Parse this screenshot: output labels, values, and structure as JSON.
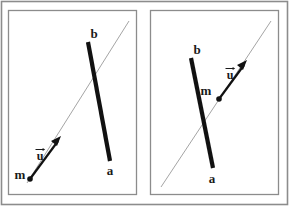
{
  "figure": {
    "width": 289,
    "height": 206,
    "background_color": "#ffffff",
    "outer_border_color": "#8c8c8c",
    "panel_border_color": "#8c8c8c",
    "thick_segment_color": "#111111",
    "thin_line_color": "#9a9a9a",
    "vector_color": "#111111",
    "label_color": "#1a1a1a"
  },
  "panels": [
    {
      "id": "left-panel",
      "name": "panel-left",
      "segment": {
        "name": "segment-ab",
        "endpoint_b_label": "b",
        "endpoint_a_label": "a",
        "b_x": 88,
        "b_y": 42,
        "a_x": 110,
        "a_y": 161,
        "stroke_width": 4.2
      },
      "labels": {
        "b": {
          "text": "b",
          "x": 95,
          "y": 37
        },
        "a": {
          "text": "a",
          "x": 107,
          "y": 173
        },
        "m": {
          "text": "m",
          "x": 16,
          "y": 178
        },
        "u": {
          "text": "u",
          "x": 37,
          "y": 157
        }
      },
      "point_m": {
        "name": "point-m",
        "x": 30,
        "y": 179,
        "r": 2.8
      },
      "vector_u": {
        "name": "vector-u",
        "from_x": 30,
        "from_y": 179,
        "to_x": 61,
        "to_y": 137,
        "stroke_width": 2.2,
        "label": "u",
        "has_arrow_accent": true
      },
      "thin_line": {
        "name": "parametric-line",
        "from_x": 27,
        "from_y": 183,
        "to_x": 129,
        "to_y": 21,
        "stroke_width": 0.9
      }
    },
    {
      "id": "right-panel",
      "name": "panel-right",
      "segment": {
        "name": "segment-ab",
        "endpoint_b_label": "b",
        "endpoint_a_label": "a",
        "b_x": 191,
        "b_y": 58,
        "a_x": 213,
        "a_y": 168,
        "stroke_width": 4.2
      },
      "labels": {
        "b": {
          "text": "b",
          "x": 196,
          "y": 53
        },
        "a": {
          "text": "a",
          "x": 208,
          "y": 182
        },
        "m": {
          "text": "m",
          "x": 202,
          "y": 94
        },
        "u": {
          "text": "u",
          "x": 227,
          "y": 78
        }
      },
      "point_m": {
        "name": "point-m",
        "x": 219,
        "y": 99,
        "r": 2.8
      },
      "vector_u": {
        "name": "vector-u",
        "from_x": 219,
        "from_y": 99,
        "to_x": 247,
        "to_y": 61,
        "stroke_width": 2.2,
        "label": "u",
        "has_arrow_accent": true
      },
      "thin_line": {
        "name": "parametric-line",
        "from_x": 161,
        "from_y": 187,
        "to_x": 271,
        "to_y": 21,
        "stroke_width": 0.9
      }
    }
  ]
}
